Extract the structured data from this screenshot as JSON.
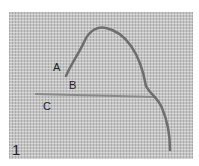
{
  "figure": {
    "step_number": "1",
    "labels": {
      "a": "A",
      "b": "B",
      "c": "C"
    },
    "colors": {
      "fabric": "#c4c4c4",
      "thread": "#6e6e6e",
      "straight_stitch": "#8a8a8a"
    }
  }
}
